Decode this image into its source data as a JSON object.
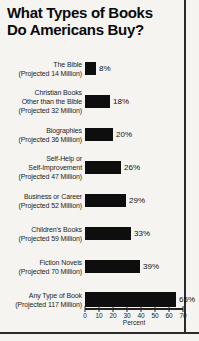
{
  "page": {
    "title_line1": "What Types of Books",
    "title_line2": "Do Americans Buy?"
  },
  "chart_data": {
    "type": "bar",
    "orientation": "horizontal",
    "title": "What Types of Books Do Americans Buy?",
    "xlabel": "Percent",
    "xlim": [
      0,
      70
    ],
    "tick_labels": [
      "0",
      "10",
      "20",
      "30",
      "40",
      "50",
      "60",
      "70"
    ],
    "grid": false,
    "categories": [
      "The Bible",
      "Christian Books Other than the Bible",
      "Biographies",
      "Self-Help or Self-Improvement",
      "Business or Career",
      "Children's Books",
      "Fiction Novels",
      "Any Type of Book"
    ],
    "projected": [
      "14 Million",
      "32 Million",
      "36 Million",
      "47 Million",
      "52 Million",
      "59 Million",
      "70 Million",
      "117 Million"
    ],
    "values": [
      8,
      18,
      20,
      26,
      29,
      33,
      39,
      65
    ],
    "rows": [
      {
        "label_lines": [
          "The Bible",
          "(Projected 14 Million)"
        ],
        "value_label": "8%"
      },
      {
        "label_lines": [
          "Christian Books",
          "Other than the Bible",
          "(Projected 32 Million)"
        ],
        "value_label": "18%"
      },
      {
        "label_lines": [
          "Biographies",
          "(Projected 36 Million)"
        ],
        "value_label": "20%"
      },
      {
        "label_lines": [
          "Self-Help or",
          "Self-Improvement",
          "(Projected 47 Million)"
        ],
        "value_label": "26%"
      },
      {
        "label_lines": [
          "Business or Career",
          "(Projected 52 Million)"
        ],
        "value_label": "29%"
      },
      {
        "label_lines": [
          "Children's Books",
          "(Projected 59 Million)"
        ],
        "value_label": "33%"
      },
      {
        "label_lines": [
          "Fiction Novels",
          "(Projected 70 Million)"
        ],
        "value_label": "39%"
      },
      {
        "label_lines": [
          "Any Type of Book",
          "(Projected 117 Million)"
        ],
        "value_label": "65%"
      }
    ],
    "colors": {
      "bar": "#0e0e0e",
      "background": "#f5f4f1",
      "rule": "#2a2a2a"
    }
  }
}
